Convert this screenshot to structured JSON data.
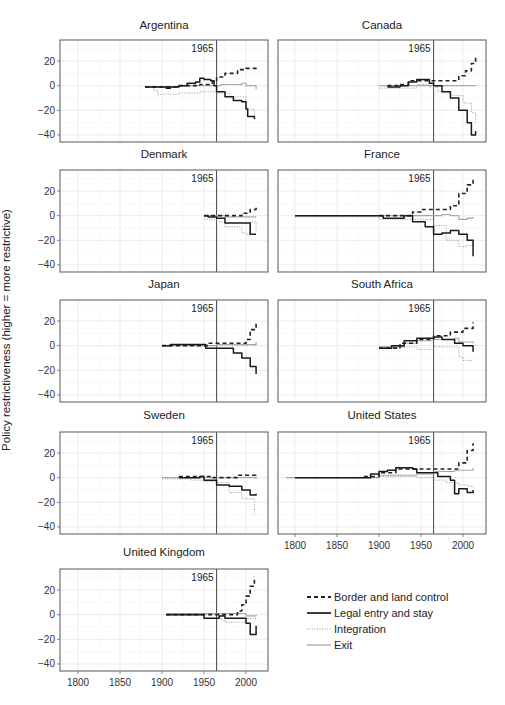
{
  "figure": {
    "y_axis_title": "Policy restrictiveness (higher = more restrictive)",
    "annotation_label": "1965",
    "annotation_year": 1965,
    "x_ticks": [
      1800,
      1850,
      1900,
      1950,
      2000
    ],
    "y_ticks": [
      20,
      0,
      -20,
      -40
    ],
    "caption_partial": ""
  },
  "legend": {
    "items": [
      {
        "label": "Border and land control",
        "style": "dashed-black"
      },
      {
        "label": "Legal entry and stay",
        "style": "solid-black"
      },
      {
        "label": "Integration",
        "style": "dotted-gray"
      },
      {
        "label": "Exit",
        "style": "solid-gray"
      }
    ]
  },
  "colors": {
    "border": "#222222",
    "legal": "#1a1a1a",
    "integration": "#9a9a9a",
    "exit": "#a8a8a8",
    "frame": "#666666",
    "grid": "#e6e6e6",
    "vline": "#444444"
  },
  "chart_data": {
    "type": "line",
    "layout": "small-multiples 5x2",
    "title": "",
    "xlabel": "",
    "ylabel": "Policy restrictiveness (higher = more restrictive)",
    "xlim": [
      1778,
      2025
    ],
    "ylim": [
      -45,
      35
    ],
    "grid": true,
    "vertical_reference": {
      "x": 1965,
      "label": "1965"
    },
    "legend_position": "bottom-right (empty cell)",
    "series_names": [
      "Border and land control",
      "Legal entry and stay",
      "Integration",
      "Exit"
    ],
    "panels": [
      {
        "country": "Argentina",
        "border": [
          [
            1880,
            -1
          ],
          [
            1920,
            0
          ],
          [
            1945,
            1
          ],
          [
            1960,
            3
          ],
          [
            1965,
            7
          ],
          [
            1975,
            10
          ],
          [
            1990,
            13
          ],
          [
            2000,
            14
          ],
          [
            2012,
            16
          ]
        ],
        "legal": [
          [
            1880,
            -1
          ],
          [
            1900,
            -1
          ],
          [
            1905,
            -2
          ],
          [
            1910,
            -1
          ],
          [
            1920,
            0
          ],
          [
            1930,
            2
          ],
          [
            1940,
            3
          ],
          [
            1945,
            6
          ],
          [
            1950,
            5
          ],
          [
            1958,
            4
          ],
          [
            1962,
            0
          ],
          [
            1965,
            -5
          ],
          [
            1975,
            -9
          ],
          [
            1985,
            -12
          ],
          [
            1995,
            -13
          ],
          [
            2000,
            -19
          ],
          [
            2002,
            -25
          ],
          [
            2010,
            -27
          ]
        ],
        "integration": [
          [
            1880,
            -1
          ],
          [
            1890,
            -4
          ],
          [
            1895,
            -7
          ],
          [
            1920,
            -6
          ],
          [
            1945,
            -5
          ],
          [
            1965,
            -6
          ],
          [
            1980,
            -9
          ],
          [
            2000,
            -19
          ],
          [
            2010,
            -27
          ]
        ],
        "exit": [
          [
            1880,
            -1
          ],
          [
            1920,
            0
          ],
          [
            1960,
            0
          ],
          [
            1970,
            1
          ],
          [
            1995,
            2
          ],
          [
            2000,
            0
          ],
          [
            2012,
            -3
          ]
        ]
      },
      {
        "country": "Canada",
        "border": [
          [
            1910,
            0
          ],
          [
            1925,
            1
          ],
          [
            1935,
            4
          ],
          [
            1965,
            4
          ],
          [
            1985,
            4
          ],
          [
            1995,
            8
          ],
          [
            2003,
            12
          ],
          [
            2010,
            18
          ],
          [
            2015,
            24
          ]
        ],
        "legal": [
          [
            1910,
            -1
          ],
          [
            1925,
            0
          ],
          [
            1935,
            3
          ],
          [
            1945,
            5
          ],
          [
            1960,
            2
          ],
          [
            1965,
            0
          ],
          [
            1975,
            -5
          ],
          [
            1985,
            -10
          ],
          [
            1995,
            -20
          ],
          [
            2005,
            -30
          ],
          [
            2010,
            -40
          ],
          [
            2015,
            -37
          ]
        ],
        "integration": [
          [
            1900,
            -2
          ],
          [
            1930,
            -2
          ],
          [
            1945,
            1
          ],
          [
            1960,
            -1
          ],
          [
            1970,
            -5
          ],
          [
            1985,
            -8
          ],
          [
            2000,
            -14
          ],
          [
            2010,
            -22
          ],
          [
            2015,
            -30
          ]
        ],
        "exit": [
          [
            1900,
            0
          ],
          [
            1960,
            0
          ],
          [
            2015,
            0
          ]
        ]
      },
      {
        "country": "Denmark",
        "border": [
          [
            1950,
            0
          ],
          [
            1970,
            0
          ],
          [
            1985,
            0
          ],
          [
            1995,
            2
          ],
          [
            2005,
            5
          ],
          [
            2012,
            8
          ]
        ],
        "legal": [
          [
            1950,
            0
          ],
          [
            1955,
            -1
          ],
          [
            1965,
            -2
          ],
          [
            1975,
            -6
          ],
          [
            2000,
            -6
          ],
          [
            2005,
            -15
          ],
          [
            2012,
            -15
          ]
        ],
        "integration": [
          [
            1950,
            -3
          ],
          [
            1965,
            -5
          ],
          [
            1975,
            -9
          ],
          [
            1995,
            -14
          ],
          [
            2000,
            -15
          ],
          [
            2005,
            -5
          ],
          [
            2012,
            -13
          ]
        ],
        "exit": [
          [
            1950,
            0
          ],
          [
            1975,
            -1
          ],
          [
            2012,
            -1
          ]
        ]
      },
      {
        "country": "France",
        "border": [
          [
            1900,
            0
          ],
          [
            1940,
            3
          ],
          [
            1950,
            5
          ],
          [
            1975,
            5
          ],
          [
            1985,
            8
          ],
          [
            1995,
            18
          ],
          [
            2005,
            25
          ],
          [
            2012,
            30
          ]
        ],
        "legal": [
          [
            1800,
            0
          ],
          [
            1900,
            0
          ],
          [
            1905,
            -2
          ],
          [
            1930,
            0
          ],
          [
            1940,
            -5
          ],
          [
            1955,
            -9
          ],
          [
            1965,
            -15
          ],
          [
            1975,
            -14
          ],
          [
            1985,
            -12
          ],
          [
            1995,
            -15
          ],
          [
            2005,
            -20
          ],
          [
            2012,
            -33
          ]
        ],
        "integration": [
          [
            1800,
            -1
          ],
          [
            1880,
            -1
          ],
          [
            1900,
            -3
          ],
          [
            1940,
            -3
          ],
          [
            1965,
            -8
          ],
          [
            1980,
            -20
          ],
          [
            1995,
            -25
          ],
          [
            2005,
            -24
          ],
          [
            2012,
            -22
          ]
        ],
        "exit": [
          [
            1800,
            0
          ],
          [
            1900,
            0
          ],
          [
            1940,
            0
          ],
          [
            1975,
            1
          ],
          [
            1985,
            0
          ],
          [
            1995,
            -3
          ],
          [
            2005,
            -2
          ],
          [
            2012,
            -1
          ]
        ]
      },
      {
        "country": "Japan",
        "border": [
          [
            1900,
            0
          ],
          [
            1950,
            0
          ],
          [
            1955,
            2
          ],
          [
            1990,
            2
          ],
          [
            2000,
            5
          ],
          [
            2005,
            13
          ],
          [
            2012,
            18
          ]
        ],
        "legal": [
          [
            1900,
            0
          ],
          [
            1910,
            1
          ],
          [
            1950,
            1
          ],
          [
            1952,
            -2
          ],
          [
            1975,
            -2
          ],
          [
            1985,
            -6
          ],
          [
            1995,
            -10
          ],
          [
            2005,
            -17
          ],
          [
            2012,
            -23
          ]
        ],
        "integration": [
          [
            1900,
            0
          ],
          [
            1955,
            0
          ],
          [
            2012,
            2
          ]
        ],
        "exit": [
          [
            1900,
            0
          ],
          [
            1950,
            0
          ],
          [
            1965,
            1
          ],
          [
            2000,
            1
          ],
          [
            2012,
            3
          ]
        ]
      },
      {
        "country": "South Africa",
        "border": [
          [
            1900,
            -2
          ],
          [
            1925,
            2
          ],
          [
            1945,
            5
          ],
          [
            1965,
            8
          ],
          [
            1985,
            11
          ],
          [
            2000,
            14
          ],
          [
            2012,
            19
          ]
        ],
        "legal": [
          [
            1900,
            -2
          ],
          [
            1915,
            0
          ],
          [
            1930,
            4
          ],
          [
            1945,
            6
          ],
          [
            1965,
            7
          ],
          [
            1975,
            5
          ],
          [
            1990,
            2
          ],
          [
            2000,
            0
          ],
          [
            2012,
            -5
          ]
        ],
        "integration": [
          [
            1900,
            -1
          ],
          [
            1935,
            -1
          ],
          [
            1945,
            -3
          ],
          [
            1965,
            -1
          ],
          [
            1990,
            -1
          ],
          [
            1995,
            -9
          ],
          [
            2000,
            -12
          ],
          [
            2012,
            -12
          ]
        ],
        "exit": [
          [
            1900,
            -1
          ],
          [
            1930,
            2
          ],
          [
            1945,
            4
          ],
          [
            1965,
            5
          ],
          [
            1990,
            6
          ],
          [
            1995,
            3
          ],
          [
            2012,
            2
          ]
        ]
      },
      {
        "country": "Sweden",
        "border": [
          [
            1920,
            1
          ],
          [
            1945,
            1
          ],
          [
            1960,
            0
          ],
          [
            1980,
            0
          ],
          [
            1990,
            2
          ],
          [
            2012,
            3
          ]
        ],
        "legal": [
          [
            1920,
            0
          ],
          [
            1945,
            1
          ],
          [
            1950,
            -2
          ],
          [
            1965,
            -6
          ],
          [
            1980,
            -7
          ],
          [
            1995,
            -10
          ],
          [
            2005,
            -14
          ],
          [
            2012,
            -13
          ]
        ],
        "integration": [
          [
            1900,
            -1
          ],
          [
            1935,
            -2
          ],
          [
            1950,
            -3
          ],
          [
            1965,
            -4
          ],
          [
            1980,
            -12
          ],
          [
            1995,
            -17
          ],
          [
            2010,
            -30
          ]
        ],
        "exit": [
          [
            1900,
            0
          ],
          [
            1965,
            0
          ],
          [
            2012,
            -1
          ]
        ]
      },
      {
        "country": "United States",
        "border": [
          [
            1882,
            1
          ],
          [
            1900,
            4
          ],
          [
            1920,
            7
          ],
          [
            1945,
            7
          ],
          [
            1985,
            7
          ],
          [
            1995,
            12
          ],
          [
            2005,
            22
          ],
          [
            2012,
            28
          ]
        ],
        "legal": [
          [
            1800,
            0
          ],
          [
            1882,
            0
          ],
          [
            1890,
            3
          ],
          [
            1900,
            5
          ],
          [
            1910,
            6
          ],
          [
            1920,
            8
          ],
          [
            1940,
            7
          ],
          [
            1945,
            4
          ],
          [
            1960,
            4
          ],
          [
            1970,
            1
          ],
          [
            1985,
            -2
          ],
          [
            1990,
            -13
          ],
          [
            1995,
            -9
          ],
          [
            2005,
            -12
          ],
          [
            2012,
            -10
          ]
        ],
        "integration": [
          [
            1790,
            0
          ],
          [
            1880,
            0
          ],
          [
            1900,
            1
          ],
          [
            1945,
            0
          ],
          [
            1965,
            -2
          ],
          [
            1980,
            -4
          ],
          [
            1995,
            -6
          ],
          [
            2005,
            -7
          ],
          [
            2012,
            -9
          ]
        ],
        "exit": [
          [
            1790,
            0
          ],
          [
            1880,
            0
          ],
          [
            1900,
            2
          ],
          [
            1945,
            3
          ],
          [
            1965,
            5
          ],
          [
            1990,
            6
          ],
          [
            2012,
            8
          ]
        ]
      },
      {
        "country": "United Kingdom",
        "border": [
          [
            1905,
            0
          ],
          [
            1985,
            0
          ],
          [
            1990,
            3
          ],
          [
            1995,
            8
          ],
          [
            2000,
            15
          ],
          [
            2005,
            23
          ],
          [
            2010,
            31
          ]
        ],
        "legal": [
          [
            1905,
            0
          ],
          [
            1945,
            0
          ],
          [
            1950,
            -3
          ],
          [
            1962,
            -3
          ],
          [
            1968,
            -1
          ],
          [
            1975,
            -3
          ],
          [
            1995,
            -3
          ],
          [
            2000,
            -7
          ],
          [
            2005,
            -16
          ],
          [
            2012,
            -9
          ]
        ],
        "integration": [
          [
            1905,
            0
          ],
          [
            1960,
            0
          ],
          [
            1970,
            -4
          ],
          [
            1975,
            -6
          ],
          [
            1990,
            -6
          ],
          [
            2000,
            -3
          ],
          [
            2012,
            -2
          ]
        ],
        "exit": [
          [
            1905,
            1
          ],
          [
            1960,
            1
          ],
          [
            1990,
            1
          ],
          [
            2000,
            -1
          ],
          [
            2012,
            0
          ]
        ]
      }
    ]
  }
}
